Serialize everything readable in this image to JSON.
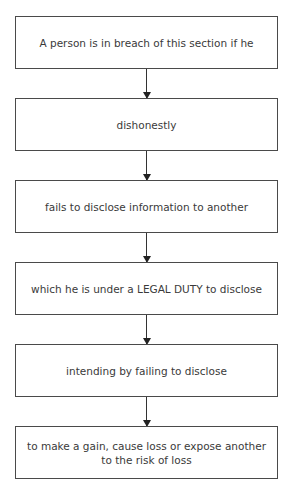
{
  "flowchart": {
    "steps": [
      {
        "label": "A person is in breach of this section if he"
      },
      {
        "label": "dishonestly"
      },
      {
        "label": "fails to disclose information to another"
      },
      {
        "label": "which he is under a LEGAL DUTY to disclose"
      },
      {
        "label": "intending by failing to disclose"
      },
      {
        "label": "to make a gain, cause loss or expose another to the risk of loss"
      }
    ]
  }
}
